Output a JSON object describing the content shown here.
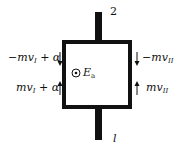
{
  "diagram": {
    "type": "junction-loop",
    "terminals": {
      "top": "2",
      "bottom": "l"
    },
    "center": {
      "symbol": "out-of-page-dot",
      "label": "E",
      "label_sub": "a"
    },
    "left_side": [
      {
        "text": "−mv",
        "sub": "I",
        "suffix": " + α",
        "arrow": "down"
      },
      {
        "text": "mv",
        "sub": "I",
        "suffix": " + α",
        "arrow": "up"
      }
    ],
    "right_side": [
      {
        "text": "−mv",
        "sub": "II",
        "suffix": "",
        "arrow": "down"
      },
      {
        "text": "mv",
        "sub": "II",
        "suffix": "",
        "arrow": "up"
      }
    ]
  }
}
